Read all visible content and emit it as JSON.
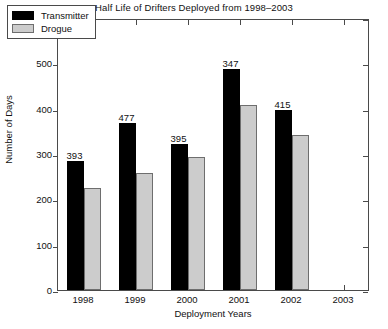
{
  "chart_data": {
    "type": "bar",
    "title": "Half Life of Drifters Deployed from 1998–2003",
    "xlabel": "Deployment Years",
    "ylabel": "Number of Days",
    "categories": [
      "1998",
      "1999",
      "2000",
      "2001",
      "2002",
      "2003"
    ],
    "ylim": [
      0,
      600
    ],
    "yticks": [
      0,
      100,
      200,
      300,
      400,
      500,
      600
    ],
    "ytick_labels": [
      "0",
      "100",
      "200",
      "300",
      "400",
      "500",
      "600"
    ],
    "grid": false,
    "legend_position": "upper-left-inside",
    "series": [
      {
        "name": "Transmitter",
        "color": "#000000",
        "values": [
          285,
          368,
          322,
          487,
          396,
          null
        ]
      },
      {
        "name": "Drogue",
        "color": "#cccccc",
        "values": [
          225,
          258,
          293,
          409,
          341,
          null
        ]
      }
    ],
    "annotations": [
      {
        "category": "1998",
        "text": "393",
        "value": 285
      },
      {
        "category": "1999",
        "text": "477",
        "value": 368
      },
      {
        "category": "2000",
        "text": "395",
        "value": 322
      },
      {
        "category": "2001",
        "text": "347",
        "value": 487
      },
      {
        "category": "2002",
        "text": "415",
        "value": 396
      }
    ]
  },
  "legend": {
    "items": [
      {
        "label": "Transmitter",
        "swatch": "transmitter"
      },
      {
        "label": "Drogue",
        "swatch": "drogue"
      }
    ]
  }
}
